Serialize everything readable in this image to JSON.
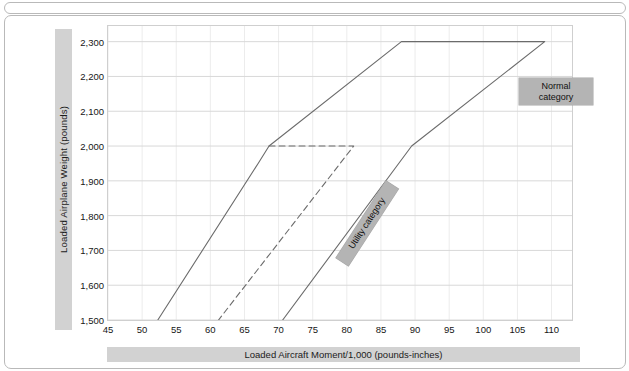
{
  "figure": {
    "y_axis_title": "Loaded  Airplane Weight (pounds)",
    "x_axis_title": "Loaded Aircraft Moment/1,000 (pounds-inches)",
    "normal_label_line1": "Normal",
    "normal_label_line2": "category",
    "utility_label": "Utility category"
  },
  "colors": {
    "band": "#d2d2d2",
    "annotation_bg": "#b4b4b4",
    "envelope_line": "#6b6b6b",
    "gridline": "#dcdcdc",
    "frame": "#b9b9b9"
  },
  "chart_data": {
    "type": "line",
    "title": "",
    "subtitle": "",
    "xlabel": "Loaded Aircraft Moment/1,000 (pounds-inches)",
    "ylabel": "Loaded  Airplane Weight (pounds)",
    "xlim": [
      45,
      113
    ],
    "ylim": [
      1500,
      2345
    ],
    "grid": true,
    "legend_position": "none",
    "xticks": [
      45,
      50,
      55,
      60,
      65,
      70,
      75,
      80,
      85,
      90,
      95,
      100,
      105,
      110
    ],
    "xticklabels": [
      "45",
      "50",
      "55",
      "60",
      "65",
      "70",
      "75",
      "80",
      "85",
      "90",
      "95",
      "100",
      "105",
      "110"
    ],
    "yticks": [
      1500,
      1600,
      1700,
      1800,
      1900,
      2000,
      2100,
      2200,
      2300
    ],
    "yticklabels": [
      "1,500",
      "1,600",
      "1,700",
      "1,800",
      "1,900",
      "2,000",
      "2,100",
      "2,200",
      "2,300"
    ],
    "series": [
      {
        "name": "Normal category envelope",
        "style": "solid",
        "closed": false,
        "points": [
          [
            52.3,
            1500
          ],
          [
            67.0,
            1950
          ],
          [
            68.6,
            2000
          ],
          [
            88.0,
            2300
          ],
          [
            109.0,
            2300
          ],
          [
            89.5,
            2000
          ],
          [
            70.6,
            1500
          ]
        ]
      },
      {
        "name": "Utility category envelope",
        "style": "dashed",
        "closed": false,
        "points": [
          [
            68.6,
            2000
          ],
          [
            81.0,
            2000
          ],
          [
            61.2,
            1500
          ]
        ]
      }
    ],
    "annotations": [
      {
        "text": "Normal category",
        "x": 97,
        "ymid": 2235,
        "rotation": 0
      },
      {
        "text": "Utility category",
        "x": 66,
        "ymid": 1800,
        "rotation": -57
      }
    ]
  }
}
